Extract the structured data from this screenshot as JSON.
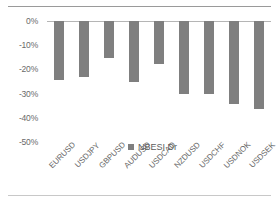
{
  "chart_data": {
    "type": "bar",
    "title": "",
    "xlabel": "",
    "ylabel": "",
    "categories": [
      "EURUSD",
      "USDJPY",
      "GBPUSD",
      "AUDUSD",
      "USDCAD",
      "NZDUSD",
      "USDCHF",
      "USDNOK",
      "USDSEK"
    ],
    "series": [
      {
        "name": "NBESI Dr",
        "color": "#7f7f7f",
        "values": [
          -24.5,
          -23.3,
          -15.3,
          -25.4,
          -17.6,
          -30.3,
          -30.3,
          -34.5,
          -36.2
        ]
      }
    ],
    "ylim": [
      -50,
      0
    ],
    "ytick_labels": [
      "0%",
      "-10%",
      "-20%",
      "-30%",
      "-40%",
      "-50%"
    ],
    "ytick_values": [
      0,
      -10,
      -20,
      -30,
      -40,
      -50
    ],
    "grid": false,
    "legend_position": "bottom-center",
    "legend_entries": [
      "NBESI Dr"
    ]
  },
  "legend": {
    "label": "NBESI Dr"
  }
}
